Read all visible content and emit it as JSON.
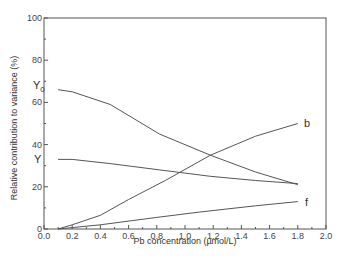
{
  "chart_data": {
    "type": "line",
    "title": "",
    "xlabel": "Pb concentration (µmol/L)",
    "ylabel": "Relative contribution to variance (%)",
    "xlim": [
      0.0,
      2.0
    ],
    "ylim": [
      0,
      100
    ],
    "x_ticks": [
      "0.0",
      "0.2",
      "0.4",
      "0.6",
      "0.8",
      "1.0",
      "1.2",
      "1.4",
      "1.6",
      "1.8",
      "2.0"
    ],
    "y_ticks": [
      "0",
      "20",
      "40",
      "60",
      "80",
      "100"
    ],
    "grid": false,
    "legend": "inline labels at line ends",
    "series": [
      {
        "name": "Y0",
        "x": [
          0.1,
          0.2,
          0.47,
          0.82,
          1.18,
          1.5,
          1.8
        ],
        "values": [
          66,
          65,
          59,
          45,
          35,
          27,
          21
        ]
      },
      {
        "name": "Y",
        "x": [
          0.1,
          0.2,
          0.47,
          0.82,
          1.18,
          1.5,
          1.8
        ],
        "values": [
          33,
          33,
          31,
          28,
          25,
          23,
          21.5
        ]
      },
      {
        "name": "b",
        "x": [
          0.1,
          0.2,
          0.4,
          0.6,
          0.86,
          1.18,
          1.5,
          1.8
        ],
        "values": [
          0,
          2,
          6.5,
          14,
          23,
          35,
          44,
          50
        ]
      },
      {
        "name": "f",
        "x": [
          0.1,
          0.4,
          0.8,
          1.1,
          1.5,
          1.8
        ],
        "values": [
          0,
          2,
          5.5,
          8,
          11,
          13
        ]
      }
    ]
  },
  "labels": {
    "y0": "Y",
    "y0_sub": "0",
    "y": "Y",
    "b": "b",
    "f": "f"
  }
}
